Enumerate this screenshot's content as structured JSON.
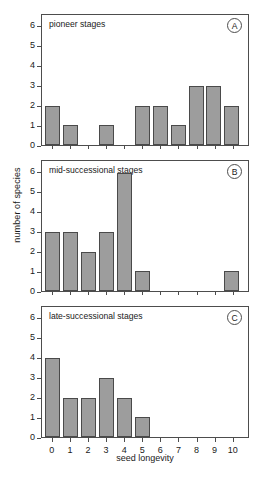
{
  "figure": {
    "xlabel": "seed longevity",
    "ylabel": "number of species"
  },
  "chart_data": {
    "type": "bar",
    "title": "",
    "xlabel": "seed longevity",
    "ylabel": "number of species",
    "xlim": [
      -0.6,
      10.9
    ],
    "ylim": [
      0,
      6.6
    ],
    "xticks": [
      "0",
      "1",
      "2",
      "3",
      "4",
      "5",
      "6",
      "7",
      "8",
      "9",
      "10"
    ],
    "yticks": [
      "0",
      "1",
      "2",
      "3",
      "4",
      "5",
      "6"
    ],
    "grid": false,
    "bar_color": "#9d9d9d",
    "bar_edge_color": "#4a4a4a",
    "panels": [
      {
        "id": "A",
        "title": "pioneer stages",
        "categories": [
          0,
          1,
          2,
          3,
          4,
          5,
          6,
          7,
          8,
          9,
          10
        ],
        "values": [
          2,
          1,
          0,
          1,
          0,
          2,
          2,
          1,
          3,
          3,
          2
        ]
      },
      {
        "id": "B",
        "title": "mid-successional stages",
        "categories": [
          0,
          1,
          2,
          3,
          4,
          5,
          6,
          7,
          8,
          9,
          10
        ],
        "values": [
          3,
          3,
          2,
          3,
          6,
          1,
          0,
          0,
          0,
          0,
          1
        ]
      },
      {
        "id": "C",
        "title": "late-successional stages",
        "categories": [
          0,
          1,
          2,
          3,
          4,
          5,
          6,
          7,
          8,
          9,
          10
        ],
        "values": [
          4,
          2,
          2,
          3,
          2,
          1,
          0,
          0,
          0,
          0,
          0
        ]
      }
    ]
  }
}
